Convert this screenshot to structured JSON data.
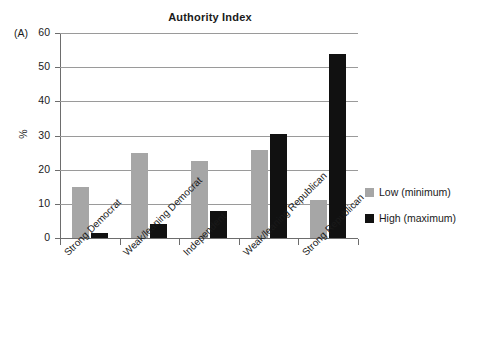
{
  "panel_letter": "(A)",
  "legend": {
    "items": [
      {
        "label": "Low (minimum)",
        "color": "#a6a6a6",
        "key": "low"
      },
      {
        "label": "High (maximum)",
        "color": "#111111",
        "key": "high"
      }
    ]
  },
  "chart_data": {
    "type": "bar",
    "title": "Authority Index",
    "xlabel": "",
    "ylabel": "%",
    "ylim": [
      0,
      60
    ],
    "yticks": [
      0,
      10,
      20,
      30,
      40,
      50,
      60
    ],
    "ytick_labels": [
      "0",
      "10",
      "20",
      "30",
      "40",
      "50",
      "60"
    ],
    "grid": true,
    "legend_position": "right",
    "categories": [
      "Strong Democrat",
      "Weak/leaning Democrat",
      "Independent",
      "Weak/leaning Republican",
      "Strong Republican"
    ],
    "series": [
      {
        "name": "Low (minimum)",
        "color": "#a6a6a6",
        "values": [
          14.9,
          25.0,
          22.5,
          25.8,
          11.0
        ]
      },
      {
        "name": "High (maximum)",
        "color": "#111111",
        "values": [
          1.6,
          4.2,
          8.0,
          30.3,
          54.0
        ]
      }
    ]
  }
}
